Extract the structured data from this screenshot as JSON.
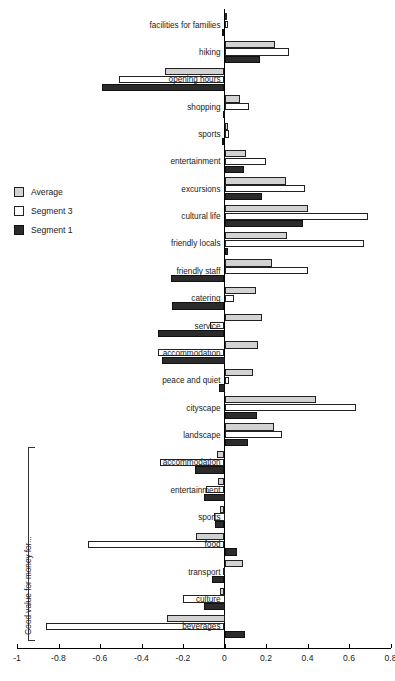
{
  "chart_data": {
    "type": "bar",
    "orientation": "horizontal",
    "title": "",
    "xlabel": "",
    "ylabel": "",
    "xlim": [
      -1,
      0.8
    ],
    "xticks": [
      -1,
      -0.8,
      -0.6,
      -0.4,
      -0.2,
      0,
      0.2,
      0.4,
      0.6,
      0.8
    ],
    "xticklabels": [
      "-1",
      "-0.8",
      "-0.6",
      "-0.4",
      "-0.2",
      "0",
      "0.2",
      "0.4",
      "0.6",
      "0.8"
    ],
    "grid": false,
    "legend_position": "left-middle",
    "series": [
      {
        "name": "Average",
        "color": "#d2d2d2",
        "values": [
          0.012,
          0.245,
          -0.285,
          0.075,
          0.018,
          0.105,
          0.295,
          0.4,
          0.3,
          0.23,
          0.15,
          0.18,
          0.16,
          0.135,
          0.44,
          0.24,
          -0.035,
          -0.03,
          -0.02,
          -0.135,
          0.09,
          -0.02,
          -0.275
        ]
      },
      {
        "name": "Segment 3",
        "color": "#ffffff",
        "values": [
          0.018,
          0.31,
          -0.51,
          0.12,
          0.022,
          0.2,
          0.39,
          0.69,
          0.67,
          0.4,
          0.045,
          -0.07,
          -0.32,
          0.02,
          0.635,
          0.275,
          -0.31,
          -0.09,
          -0.05,
          -0.66,
          -0.005,
          -0.2,
          -0.86
        ]
      },
      {
        "name": "Segment 1",
        "color": "#2b2b2b",
        "values": [
          -0.012,
          0.17,
          -0.59,
          -0.008,
          -0.01,
          0.095,
          0.18,
          0.38,
          0.015,
          -0.26,
          -0.255,
          -0.32,
          -0.3,
          -0.025,
          0.155,
          0.115,
          -0.14,
          -0.1,
          -0.045,
          0.06,
          -0.06,
          -0.1,
          0.1
        ]
      }
    ],
    "categories": [
      "facilities for families",
      "hiking",
      "opening hours",
      "shopping",
      "sports",
      "entertainment",
      "excursions",
      "cultural life",
      "friendly locals",
      "friendly staff",
      "catering",
      "service",
      "accommodation",
      "peace and quiet",
      "cityscape",
      "landscape",
      "accommodation",
      "entertainment",
      "sports",
      "food",
      "transport",
      "culture",
      "beverages"
    ],
    "annotations": [
      {
        "text": "Good value for money for...",
        "type": "group-bracket",
        "covers_categories": [
          16,
          17,
          18,
          19,
          20,
          21,
          22
        ]
      }
    ]
  },
  "legend": {
    "items": [
      {
        "label": "Average",
        "swatch": "avg"
      },
      {
        "label": "Segment 3",
        "swatch": "seg3"
      },
      {
        "label": "Segment 1",
        "swatch": "seg1"
      }
    ]
  },
  "group_bracket": {
    "label": "Good value for money for..."
  }
}
